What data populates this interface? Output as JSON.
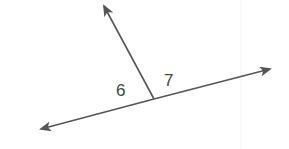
{
  "diagram": {
    "type": "angles-on-a-line",
    "colors": {
      "line": "#555555",
      "label": "#444444",
      "faint_rule": "#f0f0f0"
    },
    "lines": [
      {
        "name": "transversal-ray",
        "from": [
          154,
          99
        ],
        "to": [
          104,
          6
        ]
      },
      {
        "name": "main-line",
        "from": [
          42,
          129
        ],
        "to": [
          270,
          69
        ]
      }
    ],
    "angles": [
      {
        "label": "6",
        "x": 116,
        "y": 96
      },
      {
        "label": "7",
        "x": 164,
        "y": 86
      }
    ]
  }
}
